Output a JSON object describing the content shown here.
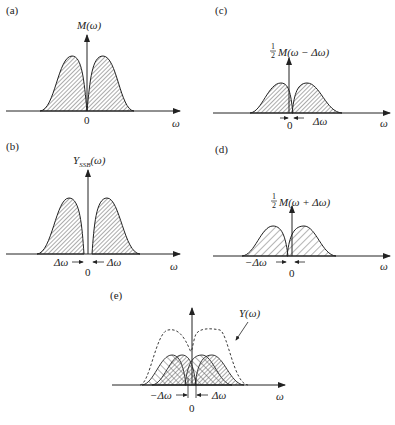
{
  "figure": {
    "panels": [
      {
        "id": "a",
        "label": "(a)",
        "ylabel": "M(ω)",
        "xlabel": "ω",
        "origin": "0"
      },
      {
        "id": "b",
        "label": "(b)",
        "ylabel_main": "Y",
        "ylabel_sub": "SSB",
        "ylabel_arg": "(ω)",
        "xlabel": "ω",
        "origin": "0",
        "left_mark": "Δω",
        "right_mark": "Δω"
      },
      {
        "id": "c",
        "label": "(c)",
        "ylabel_frac": "1/2",
        "ylabel": "M(ω − Δω)",
        "xlabel": "ω",
        "origin": "0",
        "mark": "Δω"
      },
      {
        "id": "d",
        "label": "(d)",
        "ylabel_frac": "1/2",
        "ylabel": "M(ω + Δω)",
        "xlabel": "ω",
        "origin": "0",
        "mark": "−Δω"
      },
      {
        "id": "e",
        "label": "(e)",
        "curve_label": "Y(ω)",
        "xlabel": "ω",
        "origin": "0",
        "left_mark": "−Δω",
        "right_mark": "Δω"
      }
    ]
  },
  "colors": {
    "ink": "#222222",
    "hatch": "#444444",
    "background": "#ffffff"
  }
}
